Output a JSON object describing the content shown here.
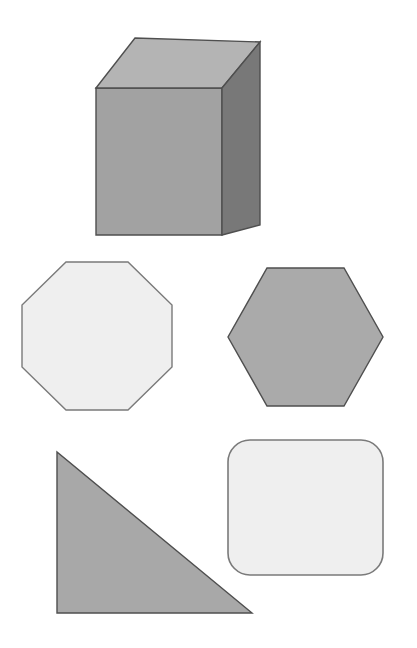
{
  "page": {
    "background_color": "#ffffff",
    "width": 417,
    "height": 648
  },
  "palette": {
    "background": "#ffffff",
    "outline": "#5a5a5a",
    "outline_soft": "#8d8d8d",
    "cube_top_face": "#b4b4b4",
    "cube_front_face": "#a2a2a2",
    "cube_side_face": "#787878",
    "octagon_fill": "#efefef",
    "hexagon_fill": "#aaaaaa",
    "triangle_fill": "#a8a8a8",
    "rounded_rect_fill": "#efefef"
  },
  "shapes": [
    {
      "id": "cube",
      "name": "cube",
      "label": "Cube",
      "kind": "3d-solid",
      "fill": "#a2a2a2",
      "stroke": "#4f4f4f",
      "stroke_width": 1.4,
      "bbox": {
        "x": 95,
        "y": 37,
        "width": 167,
        "height": 199
      },
      "faces": {
        "front": {
          "fill": "#a2a2a2",
          "points": "96,88 222,88 222,235 96,235"
        },
        "top": {
          "fill": "#b4b4b4",
          "points": "96,88 135,38 260,42 222,88"
        },
        "side": {
          "fill": "#787878",
          "points": "222,88 260,42 260,225 222,235"
        }
      }
    },
    {
      "id": "octagon",
      "name": "octagon",
      "label": "Octagon",
      "kind": "polygon",
      "sides": 8,
      "fill": "#efefef",
      "stroke": "#7a7a7a",
      "stroke_width": 1.4,
      "bbox": {
        "x": 22,
        "y": 262,
        "width": 150,
        "height": 148
      },
      "points": "66,262 128,262 172,305 172,367 128,410 66,410 22,367 22,305"
    },
    {
      "id": "hexagon",
      "name": "hexagon",
      "label": "Hexagon",
      "kind": "polygon",
      "sides": 6,
      "fill": "#aaaaaa",
      "stroke": "#4f4f4f",
      "stroke_width": 1.4,
      "bbox": {
        "x": 228,
        "y": 268,
        "width": 155,
        "height": 138
      },
      "points": "267,268 344,268 383,337 344,406 267,406 228,337"
    },
    {
      "id": "triangle",
      "name": "right-triangle",
      "label": "Right triangle",
      "kind": "polygon",
      "sides": 3,
      "fill": "#a8a8a8",
      "stroke": "#4f4f4f",
      "stroke_width": 1.4,
      "bbox": {
        "x": 57,
        "y": 452,
        "width": 195,
        "height": 161
      },
      "points": "57,452 57,613 252,613"
    },
    {
      "id": "rounded-rectangle",
      "name": "rounded-rectangle",
      "label": "Rounded rectangle",
      "kind": "rounded-rect",
      "fill": "#efefef",
      "stroke": "#7a7a7a",
      "stroke_width": 1.6,
      "bbox": {
        "x": 228,
        "y": 440,
        "width": 155,
        "height": 135
      },
      "corner_radius": 22
    }
  ]
}
